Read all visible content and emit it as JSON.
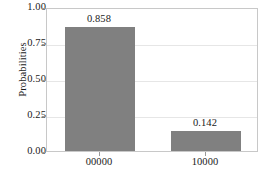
{
  "chart_data": {
    "type": "bar",
    "title": "",
    "xlabel": "",
    "ylabel": "Probabilities",
    "categories": [
      "00000",
      "10000"
    ],
    "values": [
      0.858,
      0.142
    ],
    "value_labels": [
      "0.858",
      "0.142"
    ],
    "ylim": [
      0.0,
      1.0
    ],
    "yticks": [
      0.0,
      0.25,
      0.5,
      0.75,
      1.0
    ],
    "ytick_labels": [
      "0.00",
      "0.25",
      "0.50",
      "0.75",
      "1.00"
    ],
    "grid": true,
    "legend": false,
    "bar_color": "#808080",
    "frame_color": "#c8c8c8",
    "grid_color": "#e6e6e6",
    "text_color": "#1a1a1a",
    "background": "#ffffff"
  }
}
